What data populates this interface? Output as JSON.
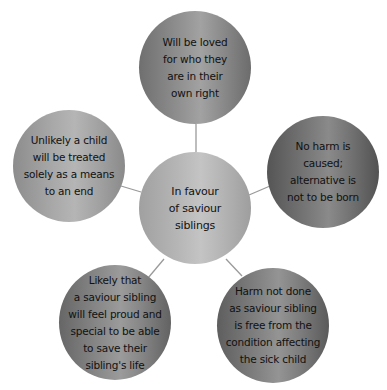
{
  "diagram": {
    "type": "spider-diagram",
    "center": {
      "label": "In favour\nof saviour\nsiblings"
    },
    "nodes": [
      {
        "position": "top",
        "label": "Will be loved\nfor who they\nare in their\nown right"
      },
      {
        "position": "right",
        "label": "No harm is\ncaused;\nalternative is\nnot to be born"
      },
      {
        "position": "bottom-right",
        "label": "Harm not done\nas saviour sibling\nis free from the\ncondition affecting\nthe sick child"
      },
      {
        "position": "bottom-left",
        "label": "Likely that\na saviour sibling\nwill feel proud and\nspecial to be able\nto save their\nsibling's life"
      },
      {
        "position": "left",
        "label": "Unlikely a child\nwill be treated\nsolely as a means\nto an end"
      }
    ],
    "colors": {
      "connector": "#9a9a9a",
      "text": "#111111",
      "background": "#ffffff"
    }
  }
}
